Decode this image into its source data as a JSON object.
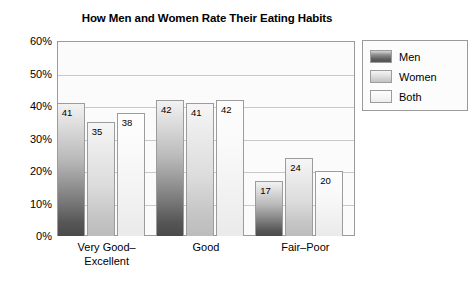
{
  "chart_data": {
    "type": "bar",
    "title": "How Men and Women Rate Their Eating Habits",
    "xlabel": "",
    "ylabel": "",
    "categories": [
      "Very Good–\nExcellent",
      "Good",
      "Fair–Poor"
    ],
    "category_lines": [
      [
        "Very Good–",
        "Excellent"
      ],
      [
        "Good"
      ],
      [
        "Fair–Poor"
      ]
    ],
    "series": [
      {
        "name": "Men",
        "values": [
          41,
          42,
          17
        ],
        "color": "#5d5d5d"
      },
      {
        "name": "Women",
        "values": [
          35,
          41,
          24
        ],
        "color": "#c6c6c6"
      },
      {
        "name": "Both",
        "values": [
          38,
          42,
          20
        ],
        "color": "#f0f0f0"
      }
    ],
    "ylim": [
      0,
      60
    ],
    "yticks": [
      0,
      10,
      20,
      30,
      40,
      50,
      60
    ],
    "ytick_labels": [
      "0%",
      "10%",
      "20%",
      "30%",
      "40%",
      "50%",
      "60%"
    ],
    "grid": true,
    "legend_position": "right-outside",
    "value_labels": true
  },
  "legend": {
    "entries": [
      {
        "label": "Men",
        "swatch": "men-swatch"
      },
      {
        "label": "Women",
        "swatch": "women-swatch"
      },
      {
        "label": "Both",
        "swatch": "both-swatch"
      }
    ]
  }
}
